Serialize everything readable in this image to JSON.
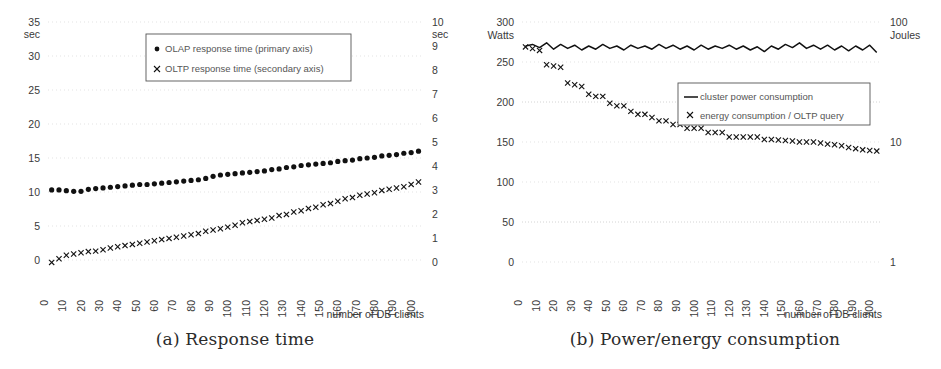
{
  "figure": {
    "panels": [
      {
        "id": "a",
        "caption": "(a) Response time",
        "legend": [
          {
            "marker": "dot",
            "label": "OLAP response time (primary axis)"
          },
          {
            "marker": "x",
            "label": "OLTP response time (secondary axis)"
          }
        ],
        "axis": {
          "left_unit": "sec",
          "right_unit": "sec",
          "xlabel": "number of DB clients",
          "left_ticks": [
            "0",
            "5",
            "10",
            "15",
            "20",
            "25",
            "30",
            "35"
          ],
          "right_ticks": [
            "0",
            "1",
            "2",
            "3",
            "4",
            "5",
            "6",
            "7",
            "8",
            "9",
            "10"
          ],
          "x_ticks": [
            "0",
            "10",
            "20",
            "30",
            "40",
            "50",
            "60",
            "70",
            "80",
            "90",
            "100",
            "110",
            "120",
            "130",
            "140",
            "150",
            "160",
            "170",
            "180",
            "190",
            "200"
          ]
        }
      },
      {
        "id": "b",
        "caption": "(b) Power/energy consumption",
        "legend": [
          {
            "marker": "line",
            "label": "cluster power consumption"
          },
          {
            "marker": "x",
            "label": "energy consumption / OLTP query"
          }
        ],
        "axis": {
          "left_unit": "Watts",
          "right_unit": "Joules",
          "xlabel": "number of DB clients",
          "left_ticks": [
            "0",
            "50",
            "100",
            "150",
            "200",
            "250",
            "300"
          ],
          "right_ticks": [
            "1",
            "10",
            "100"
          ],
          "x_ticks": [
            "0",
            "10",
            "20",
            "30",
            "40",
            "50",
            "60",
            "70",
            "80",
            "90",
            "100",
            "110",
            "120",
            "130",
            "140",
            "150",
            "160",
            "170",
            "180",
            "190",
            "200"
          ]
        }
      }
    ]
  },
  "colors": {
    "ink": "#111111",
    "grid": "#dcdcdc",
    "text": "#3a3a3a",
    "background": "#ffffff"
  },
  "chart_data": [
    {
      "type": "scatter",
      "panel": "a",
      "title": "(a) Response time",
      "xlabel": "number of DB clients",
      "ylabel": "sec",
      "y2label": "sec",
      "xlim": [
        0,
        205
      ],
      "ylim": [
        0,
        35
      ],
      "y2lim": [
        0,
        10
      ],
      "grid": true,
      "legend_position": "upper-center",
      "x": [
        2,
        6,
        10,
        14,
        18,
        22,
        26,
        30,
        34,
        38,
        42,
        46,
        50,
        54,
        58,
        62,
        66,
        70,
        74,
        78,
        82,
        86,
        90,
        94,
        98,
        102,
        106,
        110,
        114,
        118,
        122,
        126,
        130,
        134,
        138,
        142,
        146,
        150,
        154,
        158,
        162,
        166,
        170,
        174,
        178,
        182,
        186,
        190,
        194,
        198,
        202
      ],
      "series": [
        {
          "name": "OLAP response time (primary axis)",
          "axis": "primary",
          "marker": "dot",
          "unit": "sec",
          "values": [
            10.3,
            10.3,
            10.2,
            10.1,
            10.1,
            10.4,
            10.5,
            10.6,
            10.7,
            10.8,
            10.9,
            11.0,
            11.1,
            11.1,
            11.2,
            11.3,
            11.4,
            11.5,
            11.6,
            11.7,
            11.8,
            12.0,
            12.3,
            12.5,
            12.6,
            12.7,
            12.8,
            12.9,
            13.0,
            13.1,
            13.3,
            13.4,
            13.6,
            13.7,
            13.9,
            14.0,
            14.1,
            14.2,
            14.3,
            14.5,
            14.6,
            14.7,
            14.9,
            15.0,
            15.1,
            15.3,
            15.4,
            15.5,
            15.7,
            15.8,
            16.0
          ]
        },
        {
          "name": "OLTP response time (secondary axis)",
          "axis": "secondary",
          "marker": "x",
          "unit": "sec",
          "values": [
            0.15,
            0.3,
            0.45,
            0.5,
            0.55,
            0.6,
            0.62,
            0.68,
            0.75,
            0.8,
            0.85,
            0.9,
            0.95,
            1.0,
            1.05,
            1.1,
            1.15,
            1.2,
            1.25,
            1.3,
            1.35,
            1.45,
            1.5,
            1.55,
            1.62,
            1.7,
            1.8,
            1.85,
            1.9,
            1.95,
            2.0,
            2.1,
            2.15,
            2.25,
            2.3,
            2.4,
            2.45,
            2.55,
            2.6,
            2.7,
            2.8,
            2.85,
            2.95,
            3.0,
            3.05,
            3.15,
            3.2,
            3.25,
            3.3,
            3.4,
            3.5
          ]
        }
      ]
    },
    {
      "type": "line+scatter",
      "panel": "b",
      "title": "(b) Power/energy consumption",
      "xlabel": "number of DB clients",
      "ylabel": "Watts",
      "y2label": "Joules",
      "xlim": [
        0,
        205
      ],
      "ylim": [
        0,
        300
      ],
      "y2lim": [
        1,
        100
      ],
      "y2scale": "log",
      "grid": true,
      "legend_position": "center-right",
      "x": [
        2,
        6,
        10,
        14,
        18,
        22,
        26,
        30,
        34,
        38,
        42,
        46,
        50,
        54,
        58,
        62,
        66,
        70,
        74,
        78,
        82,
        86,
        90,
        94,
        98,
        102,
        106,
        110,
        114,
        118,
        122,
        126,
        130,
        134,
        138,
        142,
        146,
        150,
        154,
        158,
        162,
        166,
        170,
        174,
        178,
        182,
        186,
        190,
        194,
        198,
        202
      ],
      "series": [
        {
          "name": "cluster power consumption",
          "axis": "primary",
          "marker": "line",
          "unit": "Watts",
          "values": [
            270,
            272,
            268,
            274,
            266,
            272,
            267,
            271,
            265,
            270,
            266,
            272,
            267,
            270,
            265,
            271,
            267,
            270,
            266,
            272,
            267,
            271,
            266,
            270,
            265,
            271,
            266,
            270,
            267,
            271,
            266,
            270,
            265,
            269,
            263,
            270,
            266,
            272,
            268,
            274,
            267,
            271,
            266,
            271,
            265,
            270,
            264,
            270,
            265,
            271,
            262
          ]
        },
        {
          "name": "energy consumption / OLTP query",
          "axis": "secondary",
          "marker": "x",
          "unit": "Joules",
          "values": [
            62,
            60,
            58,
            44,
            43,
            42,
            31,
            30,
            29,
            25,
            24,
            24,
            21,
            20,
            20,
            18,
            17,
            17,
            16,
            15,
            15,
            14,
            14,
            13,
            13,
            13,
            12,
            12,
            12,
            11,
            11,
            11,
            11,
            11,
            10.5,
            10.5,
            10.4,
            10.3,
            10.2,
            10,
            10,
            10,
            9.8,
            9.6,
            9.5,
            9.3,
            9.0,
            8.8,
            8.6,
            8.5,
            8.4
          ]
        }
      ]
    }
  ]
}
